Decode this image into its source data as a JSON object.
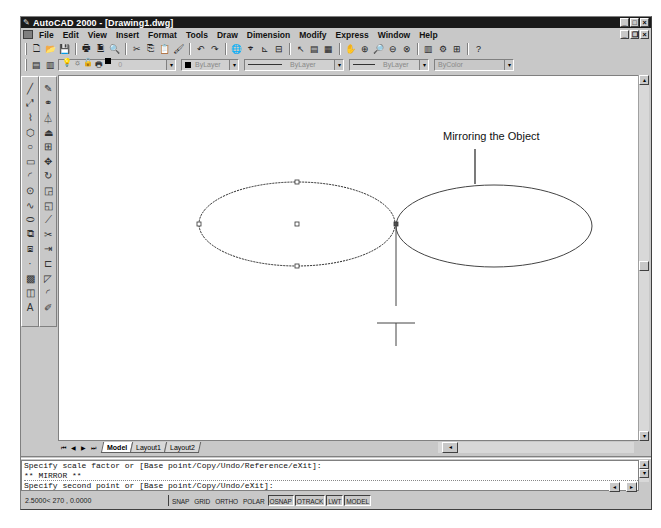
{
  "window": {
    "title": "AutoCAD 2000 - [Drawing1.dwg]",
    "controls": [
      "minimize",
      "maximize",
      "close"
    ]
  },
  "menu": {
    "items": [
      {
        "label": "File",
        "key": "F"
      },
      {
        "label": "Edit",
        "key": "E"
      },
      {
        "label": "View",
        "key": "V"
      },
      {
        "label": "Insert",
        "key": "I"
      },
      {
        "label": "Format",
        "key": "o"
      },
      {
        "label": "Tools",
        "key": "T"
      },
      {
        "label": "Draw",
        "key": "D"
      },
      {
        "label": "Dimension",
        "key": "n"
      },
      {
        "label": "Modify",
        "key": "M"
      },
      {
        "label": "Express",
        "key": "x"
      },
      {
        "label": "Window",
        "key": "W"
      },
      {
        "label": "Help",
        "key": "H"
      }
    ]
  },
  "standard_toolbar": {
    "buttons": [
      {
        "name": "new-icon",
        "glyph": "🗋"
      },
      {
        "name": "open-icon",
        "glyph": "📂"
      },
      {
        "name": "save-icon",
        "glyph": "💾"
      },
      {
        "sep": true
      },
      {
        "name": "print-icon",
        "glyph": "🖶"
      },
      {
        "name": "print-preview-icon",
        "glyph": "🗎"
      },
      {
        "name": "find-icon",
        "glyph": "🔍"
      },
      {
        "sep": true
      },
      {
        "name": "cut-icon",
        "glyph": "✂"
      },
      {
        "name": "copy-icon",
        "glyph": "⎘"
      },
      {
        "name": "paste-icon",
        "glyph": "📋"
      },
      {
        "name": "match-properties-icon",
        "glyph": "🖌"
      },
      {
        "sep": true
      },
      {
        "name": "undo-icon",
        "glyph": "↶"
      },
      {
        "name": "redo-icon",
        "glyph": "↷"
      },
      {
        "sep": true
      },
      {
        "name": "hyperlink-icon",
        "glyph": "🌐"
      },
      {
        "name": "object-snap-icon",
        "glyph": "⌖"
      },
      {
        "name": "ucs-icon",
        "glyph": "⊾"
      },
      {
        "name": "inquiry-icon",
        "glyph": "⊟"
      },
      {
        "sep": true
      },
      {
        "name": "redraw-icon",
        "glyph": "↖"
      },
      {
        "name": "properties-icon",
        "glyph": "▤"
      },
      {
        "name": "design-center-icon",
        "glyph": "▦"
      },
      {
        "sep": true
      },
      {
        "name": "pan-icon",
        "glyph": "✋"
      },
      {
        "name": "zoom-realtime-icon",
        "glyph": "⊕"
      },
      {
        "name": "zoom-window-icon",
        "glyph": "🔎"
      },
      {
        "name": "zoom-previous-icon",
        "glyph": "⊖"
      },
      {
        "name": "zoom-extents-icon",
        "glyph": "⊗"
      },
      {
        "sep": true
      },
      {
        "name": "today-icon",
        "glyph": "▥"
      },
      {
        "name": "express-tools-icon",
        "glyph": "⚙"
      },
      {
        "name": "layers-icon",
        "glyph": "⊞"
      },
      {
        "sep": true
      },
      {
        "name": "help-icon",
        "glyph": "?"
      }
    ]
  },
  "properties_toolbar": {
    "layer_value": "0",
    "color_value": "ByLayer",
    "linetype_value": "ByLayer",
    "lineweight_value": "ByLayer",
    "plotstyle_value": "ByColor"
  },
  "draw_toolbar": [
    {
      "name": "line-icon",
      "glyph": "╱"
    },
    {
      "name": "construction-line-icon",
      "glyph": "⤢"
    },
    {
      "name": "polyline-icon",
      "glyph": "⌇"
    },
    {
      "name": "polygon-icon",
      "glyph": "⬡"
    },
    {
      "name": "circle-icon",
      "glyph": "○"
    },
    {
      "name": "rectangle-icon",
      "glyph": "▭"
    },
    {
      "name": "arc-icon",
      "glyph": "◜"
    },
    {
      "name": "circle-center-icon",
      "glyph": "⊙"
    },
    {
      "name": "spline-icon",
      "glyph": "∿"
    },
    {
      "name": "ellipse-icon",
      "glyph": "⬭"
    },
    {
      "name": "insert-block-icon",
      "glyph": "⧉"
    },
    {
      "name": "make-block-icon",
      "glyph": "⧈"
    },
    {
      "name": "point-icon",
      "glyph": "·"
    },
    {
      "name": "hatch-icon",
      "glyph": "▩"
    },
    {
      "name": "region-icon",
      "glyph": "◫"
    },
    {
      "name": "multiline-text-icon",
      "glyph": "A"
    }
  ],
  "modify_toolbar": [
    {
      "name": "erase-icon",
      "glyph": "✎"
    },
    {
      "name": "copy-object-icon",
      "glyph": "⚭"
    },
    {
      "name": "mirror-icon",
      "glyph": "⏃"
    },
    {
      "name": "offset-icon",
      "glyph": "⏏"
    },
    {
      "name": "array-icon",
      "glyph": "⊞"
    },
    {
      "name": "move-icon",
      "glyph": "✥"
    },
    {
      "name": "rotate-icon",
      "glyph": "↻"
    },
    {
      "name": "scale-icon",
      "glyph": "◲"
    },
    {
      "name": "stretch-icon",
      "glyph": "◱"
    },
    {
      "name": "lengthen-icon",
      "glyph": "⟋"
    },
    {
      "name": "trim-icon",
      "glyph": "✂"
    },
    {
      "name": "extend-icon",
      "glyph": "⇥"
    },
    {
      "name": "break-icon",
      "glyph": "⊏"
    },
    {
      "name": "chamfer-icon",
      "glyph": "◸"
    },
    {
      "name": "fillet-icon",
      "glyph": "◜"
    },
    {
      "name": "explode-icon",
      "glyph": "✐"
    }
  ],
  "drawing": {
    "annotation": "Mirroring the Object"
  },
  "layout_tabs": {
    "tabs": [
      "Model",
      "Layout1",
      "Layout2"
    ],
    "active": "Model"
  },
  "command_line": {
    "lines": [
      "Specify scale factor or [Base point/Copy/Undo/Reference/eXit]:",
      "** MIRROR **",
      "Specify second point or [Base point/Copy/Undo/eXit]:"
    ]
  },
  "status_bar": {
    "coordinates": "2.5000< 270 , 0.0000",
    "toggles": [
      {
        "label": "SNAP",
        "on": false
      },
      {
        "label": "GRID",
        "on": false
      },
      {
        "label": "ORTHO",
        "on": false
      },
      {
        "label": "POLAR",
        "on": false
      },
      {
        "label": "OSNAP",
        "on": true
      },
      {
        "label": "OTRACK",
        "on": true
      },
      {
        "label": "LWT",
        "on": true
      },
      {
        "label": "MODEL",
        "on": true
      }
    ]
  }
}
